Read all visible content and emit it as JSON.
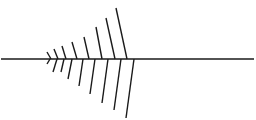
{
  "diagram": {
    "type": "herringbone-lines",
    "stroke_color": "#1a1a1a",
    "stroke_width": 1.4,
    "background": "#ffffff",
    "spine": {
      "x1": 1,
      "y1": 59,
      "x2": 254,
      "y2": 59
    },
    "upper_bones": [
      {
        "x1": 47,
        "y1": 52,
        "x2": 51,
        "y2": 59
      },
      {
        "x1": 54,
        "y1": 49,
        "x2": 58,
        "y2": 59
      },
      {
        "x1": 62,
        "y1": 46,
        "x2": 66,
        "y2": 59
      },
      {
        "x1": 72,
        "y1": 42,
        "x2": 77,
        "y2": 59
      },
      {
        "x1": 84,
        "y1": 37,
        "x2": 89,
        "y2": 59
      },
      {
        "x1": 96,
        "y1": 27,
        "x2": 102,
        "y2": 59
      },
      {
        "x1": 106,
        "y1": 18,
        "x2": 115,
        "y2": 59
      },
      {
        "x1": 116,
        "y1": 8,
        "x2": 127,
        "y2": 59
      }
    ],
    "lower_bones": [
      {
        "x1": 50,
        "y1": 59,
        "x2": 47,
        "y2": 64
      },
      {
        "x1": 57,
        "y1": 59,
        "x2": 53,
        "y2": 72
      },
      {
        "x1": 64,
        "y1": 59,
        "x2": 61,
        "y2": 72
      },
      {
        "x1": 72,
        "y1": 59,
        "x2": 68,
        "y2": 79
      },
      {
        "x1": 83,
        "y1": 59,
        "x2": 79,
        "y2": 86
      },
      {
        "x1": 95,
        "y1": 59,
        "x2": 90,
        "y2": 94
      },
      {
        "x1": 108,
        "y1": 59,
        "x2": 102,
        "y2": 103
      },
      {
        "x1": 121,
        "y1": 59,
        "x2": 114,
        "y2": 110
      },
      {
        "x1": 134,
        "y1": 59,
        "x2": 126,
        "y2": 118
      }
    ]
  }
}
